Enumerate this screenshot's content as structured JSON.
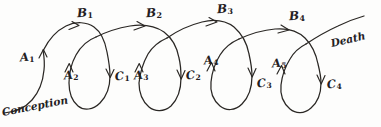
{
  "diagram": {
    "ink_color": "#2a2724",
    "background_color": "#fdfdfc",
    "style": "hand-drawn sketch",
    "start_label": "Conception",
    "end_label": "Death",
    "arcs": [
      {
        "id": "b1",
        "label": "B",
        "subscript": "1"
      },
      {
        "id": "b2",
        "label": "B",
        "subscript": "2"
      },
      {
        "id": "b3",
        "label": "B",
        "subscript": "3"
      },
      {
        "id": "b4",
        "label": "B",
        "subscript": "4"
      }
    ],
    "ascending_labels": [
      {
        "id": "a1",
        "label": "A",
        "subscript": "1"
      },
      {
        "id": "a2",
        "label": "A",
        "subscript": "2"
      },
      {
        "id": "a3",
        "label": "A",
        "subscript": "3"
      },
      {
        "id": "a4",
        "label": "A",
        "subscript": "4"
      },
      {
        "id": "a5",
        "label": "A",
        "subscript": "5"
      }
    ],
    "descending_labels": [
      {
        "id": "c1",
        "label": "C",
        "subscript": "1"
      },
      {
        "id": "c2",
        "label": "C",
        "subscript": "2"
      },
      {
        "id": "c3",
        "label": "C",
        "subscript": "3"
      },
      {
        "id": "c4",
        "label": "C",
        "subscript": "4"
      }
    ]
  }
}
